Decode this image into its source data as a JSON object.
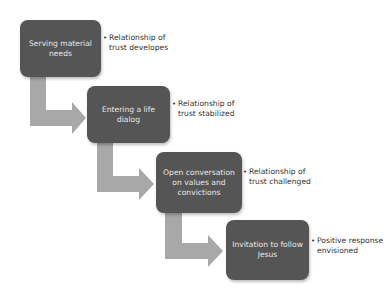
{
  "diagram": {
    "colors": {
      "box": "#555555",
      "arrow": "#a8a8a8",
      "box_text": "#e8e8e8",
      "note_text": "#333333"
    },
    "steps": [
      {
        "label": "Serving material needs",
        "note": "Relationship of trust developes"
      },
      {
        "label": "Entering a life dialog",
        "note": "Relationship of trust stabilized"
      },
      {
        "label": "Open conversation on values and convictions",
        "note": "Relationship of trust challenged"
      },
      {
        "label": "Invitation to follow Jesus",
        "note": "Positive response envisioned"
      }
    ],
    "bullet": "•"
  }
}
